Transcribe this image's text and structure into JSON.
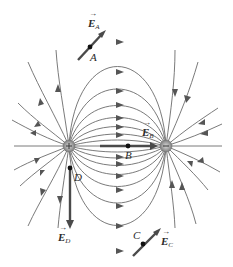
{
  "diagram": {
    "charges": [
      {
        "id": "positive",
        "sign": "+",
        "x": 69,
        "y": 146
      },
      {
        "id": "negative",
        "sign": "-",
        "x": 166,
        "y": 146
      }
    ],
    "points": [
      {
        "id": "A",
        "label": "A",
        "x": 90,
        "y": 47,
        "field_label": "E",
        "field_sub": "A"
      },
      {
        "id": "B",
        "label": "B",
        "x": 128,
        "y": 146,
        "field_label": "E",
        "field_sub": "B"
      },
      {
        "id": "C",
        "label": "C",
        "x": 143,
        "y": 244,
        "field_label": "E",
        "field_sub": "C"
      },
      {
        "id": "D",
        "label": "D",
        "x": 70,
        "y": 168,
        "field_label": "E",
        "field_sub": "D"
      }
    ],
    "colors": {
      "field_line": "#6b6b6b",
      "field_vector": "#4a4a4a",
      "charge": "#9a9a9a",
      "point": "#111111"
    }
  }
}
